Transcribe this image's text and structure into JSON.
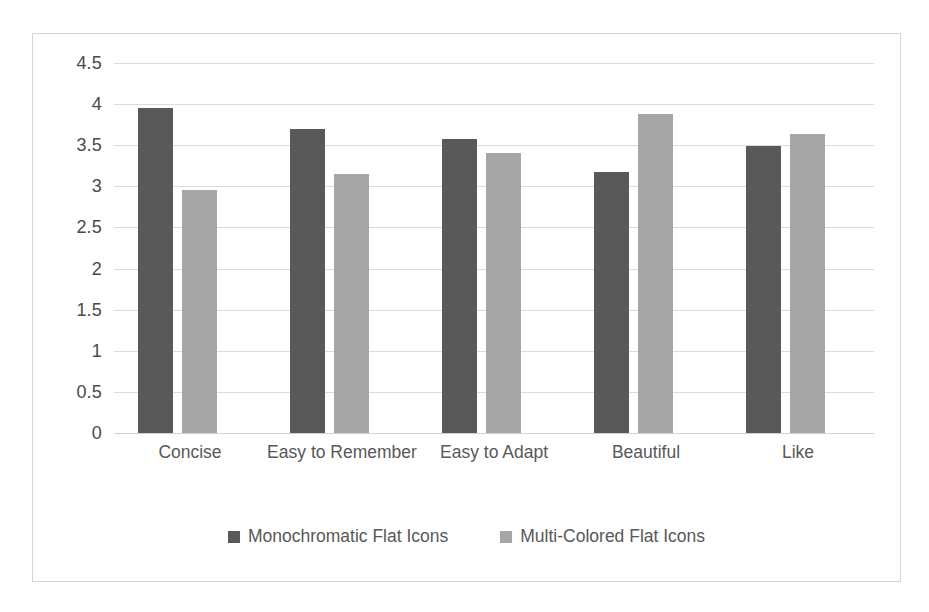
{
  "chart_data": {
    "type": "bar",
    "title": "",
    "subtitle": "",
    "xlabel": "",
    "ylabel": "",
    "categories": [
      "Concise",
      "Easy to Remember",
      "Easy to Adapt",
      "Beautiful",
      "Like"
    ],
    "series": [
      {
        "name": "Monochromatic Flat Icons",
        "color": "#595959",
        "values": [
          3.95,
          3.7,
          3.58,
          3.17,
          3.49
        ]
      },
      {
        "name": "Multi-Colored Flat Icons",
        "color": "#a6a6a6",
        "values": [
          2.96,
          3.15,
          3.4,
          3.88,
          3.64
        ]
      }
    ],
    "ylim": [
      0,
      4.5
    ],
    "ytick_labels": [
      "4.5",
      "4",
      "3.5",
      "3",
      "2.5",
      "2",
      "1.5",
      "1",
      "0.5",
      "0"
    ],
    "ytick_values": [
      4.5,
      4,
      3.5,
      3,
      2.5,
      2,
      1.5,
      1,
      0.5,
      0
    ],
    "grid": true,
    "grid_axis": "y",
    "grid_color": "#dcdcdc",
    "legend_position": "bottom",
    "plot_background": "#ffffff",
    "border_color": "#d4d4d4"
  }
}
